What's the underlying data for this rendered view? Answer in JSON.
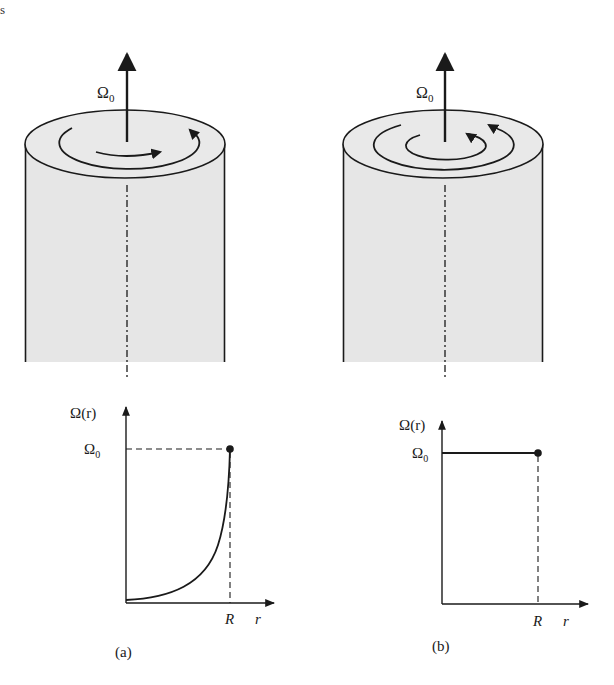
{
  "page_mark": "s",
  "panels": [
    {
      "id": "a",
      "caption": "(a)",
      "rotation_label": "Ω",
      "rotation_subscript": "0",
      "plot": {
        "y_label": "Ω(r)",
        "y_tick": "Ω",
        "y_tick_sub": "0",
        "x_tick": "R",
        "x_label": "r",
        "curve": "exponential rise from near zero at r=0 to Ω0 at r=R"
      },
      "flow_arrows": 2
    },
    {
      "id": "b",
      "caption": "(b)",
      "rotation_label": "Ω",
      "rotation_subscript": "0",
      "plot": {
        "y_label": "Ω(r)",
        "y_tick": "Ω",
        "y_tick_sub": "0",
        "x_tick": "R",
        "x_label": "r",
        "curve": "constant Ω0 from r=0 to r=R"
      },
      "flow_arrows": 2
    }
  ],
  "colors": {
    "ink": "#1a1a1a",
    "cylinder_fill": "#e6e6e6",
    "cylinder_top_fill": "#e9e9e9"
  }
}
